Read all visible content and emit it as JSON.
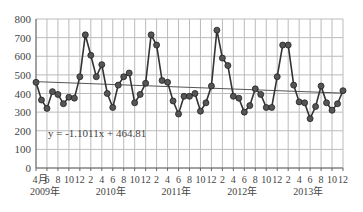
{
  "chart_data": {
    "type": "line",
    "title": "",
    "xlabel": "",
    "ylabel": "",
    "ylim": [
      0,
      800
    ],
    "yticks": [
      0,
      100,
      200,
      300,
      400,
      500,
      600,
      700,
      800
    ],
    "grid": true,
    "legend": "none",
    "x_tick_labels": [
      "4月",
      "6",
      "8",
      "10",
      "12",
      "2",
      "4",
      "6",
      "8",
      "10",
      "12",
      "2",
      "4",
      "6",
      "8",
      "10",
      "12",
      "2",
      "4",
      "6",
      "8",
      "10",
      "12",
      "2",
      "4",
      "6",
      "8",
      "10",
      "12"
    ],
    "year_labels": [
      {
        "label": "2009年",
        "month_index": 0
      },
      {
        "label": "2010年",
        "month_index": 12
      },
      {
        "label": "2011年",
        "month_index": 24
      },
      {
        "label": "2012年",
        "month_index": 36
      },
      {
        "label": "2013年",
        "month_index": 48
      }
    ],
    "x_start": "2009-04",
    "x_end": "2013-12",
    "series": [
      {
        "name": "monthly",
        "values": [
          460,
          365,
          320,
          410,
          395,
          345,
          380,
          375,
          490,
          715,
          605,
          490,
          555,
          400,
          325,
          445,
          490,
          510,
          350,
          395,
          455,
          715,
          660,
          470,
          460,
          360,
          290,
          385,
          385,
          400,
          305,
          350,
          440,
          740,
          590,
          550,
          385,
          375,
          300,
          335,
          425,
          395,
          325,
          325,
          490,
          660,
          660,
          445,
          355,
          350,
          265,
          330,
          440,
          350,
          310,
          345,
          415
        ]
      }
    ],
    "trendline": {
      "equation": "y = -1.1011x + 464.81",
      "slope": -1.1011,
      "intercept": 464.81
    }
  },
  "colors": {
    "line": "#333333",
    "marker_fill": "#555555",
    "grid": "#bbbbbb",
    "axis": "#666666",
    "text": "#444444"
  }
}
